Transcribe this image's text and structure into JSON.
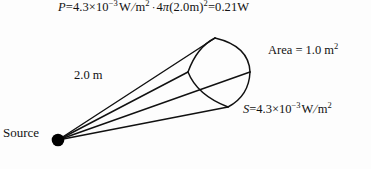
{
  "figure": {
    "background_color": "#fdfdfd",
    "line_color": "#111111",
    "source_dot_color": "#000000"
  },
  "equations": {
    "power": {
      "lhs": "P",
      "full_text": "P = 4.3 × 10⁻³ W/m² · 4π(2.0 m)² = 0.21 W",
      "intensity_value": "4.3",
      "intensity_exponent": "−3",
      "intensity_unit_num": "W",
      "intensity_unit_den": "m",
      "intensity_unit_den_exp": "2",
      "area_coefficient": "4",
      "pi_symbol": "π",
      "radius_value": "2.0",
      "radius_unit": "m",
      "radius_exponent": "2",
      "result_value": "0.21",
      "result_unit": "W",
      "equals": "=",
      "times": "×",
      "cdot": "·",
      "ten": "10"
    },
    "intensity": {
      "lhs": "S",
      "full_text": "S = 4.3 × 10⁻³ W/m²",
      "value": "4.3",
      "exponent": "−3",
      "unit_num": "W",
      "unit_den": "m",
      "unit_den_exp": "2",
      "equals": "=",
      "times": "×",
      "ten": "10"
    }
  },
  "labels": {
    "area": {
      "name": "Area",
      "equals": "=",
      "value": "1.0",
      "unit": "m",
      "unit_exponent": "2",
      "full_text": "Area = 1.0 m²"
    },
    "distance": {
      "value": "2.0",
      "unit": "m",
      "full_text": "2.0 m"
    },
    "source": {
      "text": "Source"
    }
  },
  "geometry": {
    "source_point": {
      "x": 58,
      "y": 140
    },
    "patch_corners": {
      "top": {
        "x": 215,
        "y": 38
      },
      "right": {
        "x": 250,
        "y": 72
      },
      "bottom": {
        "x": 228,
        "y": 107
      },
      "left": {
        "x": 188,
        "y": 72
      }
    },
    "ray_count": 4
  }
}
